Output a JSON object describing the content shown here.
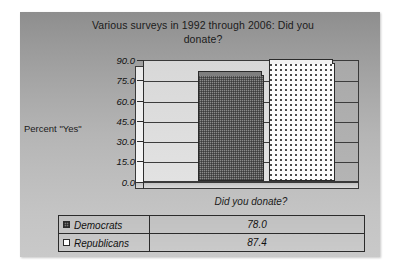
{
  "chart_data": {
    "type": "bar",
    "title": "Various surveys in 1992 through 2006:  Did you donate?",
    "title_line1": "Various surveys in 1992 through 2006:  Did you",
    "title_line2": "donate?",
    "xlabel": "Did you donate?",
    "ylabel": "Percent \"Yes\"",
    "categories": [
      "Did you donate?"
    ],
    "series": [
      {
        "name": "Democrats",
        "values": [
          78.0
        ],
        "value_label": "78.0",
        "swatch": "dark-checker"
      },
      {
        "name": "Republicans",
        "values": [
          87.4
        ],
        "value_label": "87.4",
        "swatch": "white-dotted"
      }
    ],
    "ylim": [
      0.0,
      90.0
    ],
    "ytick_values": [
      0.0,
      15.0,
      30.0,
      45.0,
      60.0,
      75.0,
      90.0
    ],
    "ytick_labels": [
      "0.0",
      "15.0",
      "30.0",
      "45.0",
      "60.0",
      "75.0",
      "90.0"
    ],
    "grid": true,
    "legend_position": "bottom-table",
    "style": "3d-panel"
  },
  "table": {
    "rows": [
      {
        "name": "Democrats",
        "value": "78.0"
      },
      {
        "name": "Republicans",
        "value": "87.4"
      }
    ]
  },
  "colors": {
    "panel_top": "#8e8e8e",
    "panel_bottom": "#c9c9c9",
    "bar_democrats": "#8a8a8a",
    "bar_republicans": "#fbfbfb",
    "axis": "#2e2e2e",
    "text": "#1b1b1b"
  }
}
